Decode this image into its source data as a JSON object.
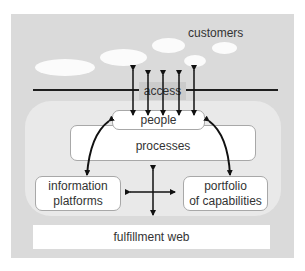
{
  "diagram": {
    "customers_label": "customers",
    "access_label": "access",
    "people_label": "people",
    "processes_label": "processes",
    "information_platforms": {
      "line1": "information",
      "line2": "platforms"
    },
    "portfolio": {
      "line1": "portfolio",
      "line2": "of capabilities"
    },
    "fulfillment_label": "fulfillment web"
  },
  "colors": {
    "panel": "#dadada",
    "inner": "#e9e9e9",
    "box": "#ffffff",
    "arrow": "#111111"
  }
}
